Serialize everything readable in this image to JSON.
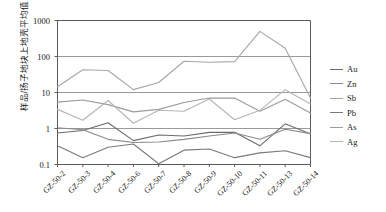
{
  "chart_data": {
    "type": "line",
    "title": "",
    "xlabel": "",
    "ylabel": "样品/扬子地块上地壳平均值",
    "yscale": "log",
    "ylim": [
      0.1,
      1000
    ],
    "ytick_labels": [
      "1000",
      "100",
      "10",
      "1",
      "0.1"
    ],
    "ytick_values": [
      1000,
      100,
      10,
      1,
      0.1
    ],
    "grid": "horizontal",
    "legend_position": "right",
    "categories": [
      "GZ-50-2",
      "GZ-50-3",
      "GZ-50-4",
      "GZ-50-6",
      "GZ-50-7",
      "GZ-50-8",
      "GZ-50-9",
      "GZ-50-10",
      "GZ-50-11",
      "GZ-50-13",
      "GZ-50-14"
    ],
    "series": [
      {
        "name": "Au",
        "color": "#6b6b6b",
        "values": [
          0.75,
          0.88,
          1.45,
          0.46,
          0.66,
          0.62,
          0.78,
          0.79,
          0.33,
          1.35,
          0.7
        ]
      },
      {
        "name": "Zn",
        "color": "#8a8a8a",
        "values": [
          1.05,
          0.92,
          0.5,
          0.41,
          0.42,
          0.5,
          0.62,
          0.75,
          0.5,
          0.95,
          0.72
        ]
      },
      {
        "name": "Sb",
        "color": "#a6a6a6",
        "values": [
          14.5,
          43.0,
          41.0,
          12.0,
          19.0,
          74.0,
          69.0,
          72.0,
          500.0,
          170.0,
          7.0
        ]
      },
      {
        "name": "Pb",
        "color": "#7a7a7a",
        "values": [
          0.33,
          0.155,
          0.3,
          0.37,
          0.105,
          0.25,
          0.27,
          0.155,
          0.21,
          0.24,
          0.155
        ]
      },
      {
        "name": "As",
        "color": "#9b9b9b",
        "values": [
          5.4,
          6.2,
          4.6,
          2.9,
          3.4,
          5.3,
          7.0,
          7.0,
          3.0,
          6.5,
          2.7
        ]
      },
      {
        "name": "Ag",
        "color": "#b5b5b5",
        "values": [
          3.4,
          1.7,
          6.0,
          1.4,
          3.2,
          3.0,
          6.6,
          1.75,
          3.2,
          12.0,
          4.8
        ]
      }
    ]
  },
  "legend": {
    "items": [
      {
        "label": "Au"
      },
      {
        "label": "Zn"
      },
      {
        "label": "Sb"
      },
      {
        "label": "Pb"
      },
      {
        "label": "As"
      },
      {
        "label": "Ag"
      }
    ]
  }
}
